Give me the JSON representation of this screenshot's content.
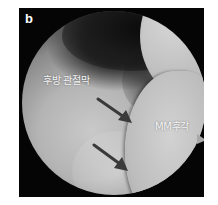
{
  "figure": {
    "panel_letter": "b",
    "labels": {
      "capsule": "후방 관절막",
      "meniscus": "MM후각"
    },
    "arrows": [
      {
        "name": "upper-arrow",
        "direction": "down-right"
      },
      {
        "name": "lower-arrow",
        "direction": "down-right"
      }
    ],
    "colors": {
      "frame": "#050505",
      "tissue": "#bdbdbd",
      "arrow": "#3a3a3a",
      "label": "#f4f4f4"
    }
  }
}
